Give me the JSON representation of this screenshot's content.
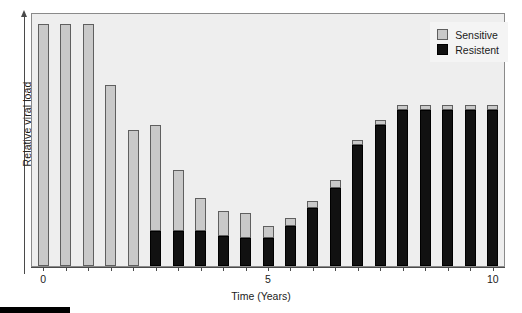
{
  "chart_data": {
    "type": "bar",
    "stacked": true,
    "title": "",
    "xlabel": "Time (Years)",
    "ylabel": "Relative viral load",
    "xlim": [
      -0.25,
      10.25
    ],
    "ylim": [
      0,
      100
    ],
    "grid": false,
    "x_tick_labels": [
      "0",
      "5",
      "10"
    ],
    "x_tick_values": [
      0,
      5,
      10
    ],
    "y_tick_labels": [],
    "legend_position": "top-right",
    "x": [
      0,
      0.5,
      1,
      1.5,
      2,
      2.5,
      3,
      3.5,
      4,
      4.5,
      5,
      5.5,
      6,
      6.5,
      7,
      7.5,
      8,
      8.5,
      9,
      9.5,
      10
    ],
    "series": [
      {
        "name": "Sensitive",
        "color": "#c9c9c9",
        "values": [
          96,
          96,
          96,
          0,
          68,
          0,
          45,
          0,
          23,
          0,
          19,
          0,
          13,
          0,
          4,
          0,
          3,
          0,
          2,
          2,
          2
        ]
      },
      {
        "name": "Resistent",
        "color": "#111111",
        "values": [
          0,
          0,
          0,
          0,
          14,
          0,
          14,
          0,
          12,
          0,
          11,
          0,
          9,
          0,
          16,
          0,
          31,
          0,
          48,
          62,
          62
        ]
      }
    ],
    "bars": [
      {
        "x": 0,
        "sensitive": 96,
        "resistent": 0
      },
      {
        "x": 0.5,
        "sensitive": 96,
        "resistent": 0
      },
      {
        "x": 1,
        "sensitive": 96,
        "resistent": 0
      },
      {
        "x": 1.5,
        "sensitive": 72,
        "resistent": 0
      },
      {
        "x": 2,
        "sensitive": 54,
        "resistent": 0
      },
      {
        "x": 2.5,
        "sensitive": 42,
        "resistent": 14
      },
      {
        "x": 3,
        "sensitive": 24,
        "resistent": 14
      },
      {
        "x": 3.5,
        "sensitive": 13,
        "resistent": 14
      },
      {
        "x": 4,
        "sensitive": 10,
        "resistent": 12
      },
      {
        "x": 4.5,
        "sensitive": 10,
        "resistent": 11
      },
      {
        "x": 5,
        "sensitive": 5,
        "resistent": 11
      },
      {
        "x": 5.5,
        "sensitive": 3,
        "resistent": 16
      },
      {
        "x": 6,
        "sensitive": 3,
        "resistent": 23
      },
      {
        "x": 6.5,
        "sensitive": 3,
        "resistent": 31
      },
      {
        "x": 7,
        "sensitive": 2,
        "resistent": 48
      },
      {
        "x": 7.5,
        "sensitive": 2,
        "resistent": 56
      },
      {
        "x": 8,
        "sensitive": 2,
        "resistent": 62
      },
      {
        "x": 8.5,
        "sensitive": 2,
        "resistent": 62
      },
      {
        "x": 9,
        "sensitive": 2,
        "resistent": 62
      },
      {
        "x": 9.5,
        "sensitive": 2,
        "resistent": 62
      },
      {
        "x": 10,
        "sensitive": 2,
        "resistent": 62
      }
    ],
    "legend": [
      {
        "label": "Sensitive",
        "color": "#c9c9c9"
      },
      {
        "label": "Resistent",
        "color": "#111111"
      }
    ]
  },
  "axes": {
    "y_label": "Relative viral load",
    "x_label": "Time (Years)",
    "x_ticks": [
      {
        "label": "0",
        "value": 0
      },
      {
        "label": "5",
        "value": 5
      },
      {
        "label": "10",
        "value": 10
      }
    ]
  },
  "legend": {
    "sensitive_label": "Sensitive",
    "resistent_label": "Resistent"
  },
  "caption": {
    "text": ""
  }
}
